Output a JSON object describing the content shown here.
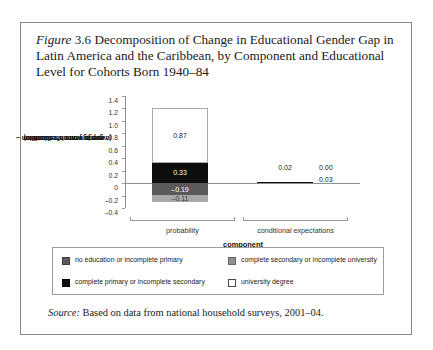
{
  "figure": {
    "label_word": "Figure",
    "number": "3.6",
    "caption": "Decomposition of Change in Educational Gender Gap in Latin America and the Caribbean, by Component and Educational Level for Cohorts Born 1940–84",
    "source_word": "Source:",
    "source_text": "Based on data from national household surveys, 2001–04."
  },
  "chart_data": {
    "type": "bar",
    "subtype": "stacked-bar",
    "title": "",
    "xlabel": "component",
    "ylabel": "gap in years of education (average women's education – average men's education)",
    "ylabel_line1": "gap in years of education",
    "ylabel_line2": "(average women's education –",
    "ylabel_line3": "average men's education)",
    "categories": [
      "probability",
      "conditional expectations"
    ],
    "ylim": [
      -0.4,
      1.4
    ],
    "ytick_labels": [
      "1.4",
      "1.2",
      "1.0",
      "0.8",
      "0.6",
      "0.4",
      "0.2",
      "0",
      "–0.2",
      "–0.4"
    ],
    "ytick_values": [
      1.4,
      1.2,
      1.0,
      0.8,
      0.6,
      0.4,
      0.2,
      0,
      -0.2,
      -0.4
    ],
    "grid": false,
    "legend_position": "below-plot",
    "series": [
      {
        "name": "no education or incomplete primary",
        "color": "#5a5a5a",
        "values": [
          -0.19,
          0.14
        ],
        "value_labels": [
          "–0.19",
          "0.14"
        ]
      },
      {
        "name": "complete primary or incomplete secondary",
        "color": "#0d0d0d",
        "values": [
          0.33,
          0.02
        ],
        "value_labels": [
          "0.33",
          "0.02"
        ]
      },
      {
        "name": "complete secondary or incomplete university",
        "color": "#8f8f8f",
        "values": [
          -0.11,
          0.03
        ],
        "value_labels": [
          "–0.11",
          "0.03"
        ]
      },
      {
        "name": "university degree",
        "color": "#ffffff",
        "values": [
          0.87,
          0.0
        ],
        "value_labels": [
          "0.87",
          "0.00"
        ]
      }
    ]
  },
  "legend": {
    "items": [
      {
        "label": "no education or incomplete primary",
        "swatch": "dgray"
      },
      {
        "label": "complete secondary or incomplete university",
        "swatch": "mgray"
      },
      {
        "label": "complete primary or incomplete secondary",
        "swatch": "black"
      },
      {
        "label": "university degree",
        "swatch": "white"
      }
    ]
  }
}
